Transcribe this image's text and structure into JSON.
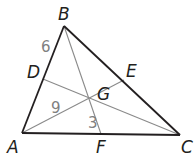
{
  "diagram": {
    "colors": {
      "triangle_stroke": "#231f20",
      "median_stroke": "#8a8a8a",
      "vertex_label": "#231f20",
      "number_label": "#808080"
    },
    "vertices": {
      "A": {
        "label": "A",
        "x": 22,
        "y": 133
      },
      "B": {
        "label": "B",
        "x": 64,
        "y": 26
      },
      "C": {
        "label": "C",
        "x": 180,
        "y": 135
      }
    },
    "points": {
      "D": {
        "label": "D",
        "x": 43,
        "y": 79
      },
      "E": {
        "label": "E",
        "x": 124,
        "y": 80
      },
      "F": {
        "label": "F",
        "x": 101,
        "y": 134
      },
      "G": {
        "label": "G",
        "x": 101,
        "y": 103
      }
    },
    "segment_labels": {
      "BD": "6",
      "AG": "9",
      "GF": "3"
    }
  }
}
